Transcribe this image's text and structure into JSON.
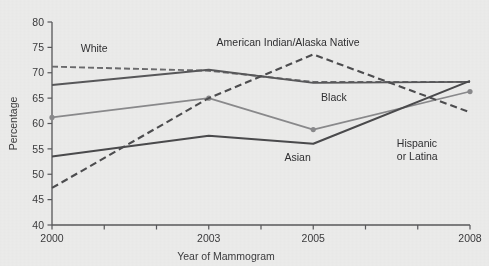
{
  "chart_data": {
    "type": "line",
    "title": "",
    "xlabel": "Year of Mammogram",
    "ylabel": "Percentage",
    "x": [
      2000,
      2003,
      2005,
      2008
    ],
    "xlim": [
      2000,
      2008
    ],
    "ylim": [
      40,
      80
    ],
    "x_tick_values": [
      2000,
      2001,
      2002,
      2003,
      2004,
      2005,
      2006,
      2007,
      2008
    ],
    "x_tick_labels": [
      "2000",
      "",
      "",
      "2003",
      "",
      "2005",
      "",
      "",
      "2008"
    ],
    "y_ticks": [
      40,
      45,
      50,
      55,
      60,
      65,
      70,
      75,
      80
    ],
    "y_tick_labels": [
      "40",
      "45",
      "50",
      "55",
      "60",
      "65",
      "70",
      "75",
      "80"
    ],
    "grid": false,
    "legend": "inline-labels",
    "series": [
      {
        "name": "White",
        "label": "White",
        "values": [
          71.2,
          70.4,
          68.2,
          68.2
        ],
        "style": "dashed",
        "color": "#6b6b6d",
        "width": 1.9,
        "dash": "6,3",
        "markers": false,
        "label_x": 2000.55,
        "label_y": 74.1
      },
      {
        "name": "Black",
        "label": "Black",
        "values": [
          67.6,
          70.6,
          68.0,
          68.2
        ],
        "style": "solid",
        "color": "#58585a",
        "width": 1.9,
        "dash": "none",
        "markers": false,
        "label_x": 2005.15,
        "label_y": 64.4
      },
      {
        "name": "Hispanic or Latina",
        "label": "Hispanic\nor Latina",
        "values": [
          61.2,
          65.0,
          58.8,
          66.3
        ],
        "style": "solid",
        "color": "#8a8a8c",
        "width": 1.7,
        "dash": "none",
        "markers": true,
        "label_x": 2006.6,
        "label_y": 55.3
      },
      {
        "name": "Asian",
        "label": "Asian",
        "values": [
          53.5,
          57.6,
          56.0,
          68.4
        ],
        "style": "solid",
        "color": "#4a4a4c",
        "width": 2.1,
        "dash": "none",
        "markers": false,
        "label_x": 2004.45,
        "label_y": 52.6
      },
      {
        "name": "American Indian/Alaska Native",
        "label": "American Indian/Alaska Native",
        "values": [
          47.3,
          65.0,
          73.6,
          62.2
        ],
        "style": "dashed",
        "color": "#4d4d4f",
        "width": 2.1,
        "dash": "7,4",
        "markers": false,
        "label_x": 2003.15,
        "label_y": 75.3
      }
    ],
    "annotations": [
      {
        "text": "White",
        "series": "White"
      },
      {
        "text": "Black",
        "series": "Black"
      },
      {
        "text": "Asian",
        "series": "Asian"
      },
      {
        "text": "Hispanic",
        "series": "Hispanic or Latina"
      },
      {
        "text": "or Latina",
        "series": "Hispanic or Latina"
      },
      {
        "text": "American Indian/Alaska Native",
        "series": "American Indian/Alaska Native"
      }
    ]
  },
  "colors": {
    "background": "#ececeb",
    "axis": "#58585a",
    "text": "#3b3b3d"
  }
}
